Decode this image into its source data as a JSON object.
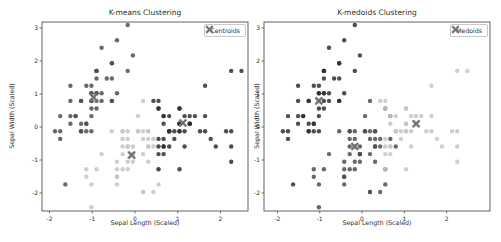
{
  "figure": {
    "background": "#ffffff",
    "spine_color": "#3a3a3a",
    "text_color": "#2e2e2e"
  },
  "chart_data": [
    {
      "type": "scatter",
      "title": "K-means Clustering",
      "xlabel": "Sepal Length (Scaled)",
      "ylabel": "Sepal Width (Scaled)",
      "xlim": [
        -2.175,
        2.643
      ],
      "ylim": [
        -2.545,
        3.182
      ],
      "xticks": [
        -2,
        -1,
        0,
        1,
        2
      ],
      "yticks": [
        -2,
        -1,
        0,
        1,
        2,
        3
      ],
      "grid": false,
      "legend": {
        "label": "Centroids",
        "marker": "x-marker-icon",
        "position": "upper-right"
      },
      "marker_color": "#8a8a8a",
      "marker_core_color": "#5e5e5e",
      "cluster_colors": [
        "#4f4f4f",
        "#c6c6c6",
        "#2f2f2f"
      ],
      "point_radius": 2.2,
      "centers": [
        [
          -0.97,
          0.9
        ],
        [
          -0.08,
          -0.85
        ],
        [
          1.12,
          0.12
        ]
      ],
      "points": [
        [
          -0.9,
          1.02
        ],
        [
          -1.14,
          -0.13
        ],
        [
          -1.39,
          0.33
        ],
        [
          -1.51,
          0.1
        ],
        [
          -1.02,
          1.25
        ],
        [
          -0.54,
          1.93
        ],
        [
          -1.51,
          0.79
        ],
        [
          -1.02,
          0.79
        ],
        [
          -1.75,
          -0.36
        ],
        [
          -1.14,
          0.1
        ],
        [
          -0.54,
          1.47
        ],
        [
          -1.26,
          0.79
        ],
        [
          -1.26,
          -0.13
        ],
        [
          -1.87,
          -0.13
        ],
        [
          -0.05,
          2.17
        ],
        [
          -0.17,
          3.09
        ],
        [
          -0.54,
          1.93
        ],
        [
          -0.9,
          1.02
        ],
        [
          -0.17,
          1.7
        ],
        [
          -0.9,
          1.7
        ],
        [
          -0.54,
          0.79
        ],
        [
          -0.9,
          1.47
        ],
        [
          -1.51,
          1.25
        ],
        [
          -0.9,
          0.56
        ],
        [
          -1.26,
          0.79
        ],
        [
          -1.02,
          -0.13
        ],
        [
          -1.02,
          0.79
        ],
        [
          -0.78,
          1.02
        ],
        [
          -0.78,
          0.79
        ],
        [
          -1.39,
          0.33
        ],
        [
          -1.26,
          0.1
        ],
        [
          -0.54,
          0.79
        ],
        [
          -0.78,
          2.4
        ],
        [
          -0.42,
          2.63
        ],
        [
          -1.14,
          0.1
        ],
        [
          -1.02,
          0.33
        ],
        [
          -0.42,
          1.02
        ],
        [
          -1.14,
          1.25
        ],
        [
          -1.75,
          -0.13
        ],
        [
          -0.9,
          0.79
        ],
        [
          -1.02,
          1.02
        ],
        [
          -1.63,
          -1.74
        ],
        [
          -1.75,
          0.33
        ],
        [
          -1.02,
          1.02
        ],
        [
          -0.9,
          1.7
        ],
        [
          -1.26,
          -0.13
        ],
        [
          -0.9,
          1.7
        ],
        [
          -1.51,
          0.33
        ],
        [
          -0.66,
          1.47
        ],
        [
          -1.02,
          0.56
        ],
        [
          1.4,
          0.33
        ],
        [
          0.67,
          0.33
        ],
        [
          1.28,
          0.1
        ],
        [
          -0.42,
          -1.74
        ],
        [
          0.8,
          -0.59
        ],
        [
          -0.17,
          -0.59
        ],
        [
          0.55,
          0.56
        ],
        [
          -1.14,
          -1.51
        ],
        [
          0.92,
          -0.36
        ],
        [
          -0.78,
          -0.82
        ],
        [
          -1.02,
          -2.43
        ],
        [
          0.07,
          -0.13
        ],
        [
          0.19,
          -1.97
        ],
        [
          0.31,
          -0.36
        ],
        [
          -0.29,
          -0.36
        ],
        [
          1.04,
          0.1
        ],
        [
          -0.29,
          -0.13
        ],
        [
          -0.05,
          -0.82
        ],
        [
          0.43,
          -1.97
        ],
        [
          -0.29,
          -1.28
        ],
        [
          0.07,
          0.33
        ],
        [
          0.31,
          -0.59
        ],
        [
          0.55,
          -1.28
        ],
        [
          0.31,
          -0.59
        ],
        [
          0.67,
          -0.36
        ],
        [
          0.92,
          -0.13
        ],
        [
          1.16,
          -0.59
        ],
        [
          1.04,
          -0.13
        ],
        [
          0.19,
          -0.36
        ],
        [
          -0.17,
          -1.05
        ],
        [
          -0.42,
          -1.51
        ],
        [
          -0.42,
          -1.51
        ],
        [
          -0.05,
          -0.82
        ],
        [
          0.19,
          -0.82
        ],
        [
          -0.54,
          -0.13
        ],
        [
          0.19,
          0.79
        ],
        [
          1.04,
          0.1
        ],
        [
          0.55,
          -1.74
        ],
        [
          -0.29,
          -0.13
        ],
        [
          -0.42,
          -1.28
        ],
        [
          -0.42,
          -1.05
        ],
        [
          0.31,
          -0.13
        ],
        [
          -0.05,
          -1.05
        ],
        [
          -1.02,
          -1.74
        ],
        [
          -0.29,
          -0.82
        ],
        [
          -0.17,
          -0.13
        ],
        [
          -0.17,
          -0.36
        ],
        [
          0.43,
          -0.36
        ],
        [
          -0.9,
          -1.28
        ],
        [
          -0.17,
          -0.59
        ],
        [
          0.55,
          0.56
        ],
        [
          -0.05,
          -0.82
        ],
        [
          1.52,
          -0.13
        ],
        [
          0.55,
          -0.36
        ],
        [
          0.8,
          -0.13
        ],
        [
          2.13,
          -0.13
        ],
        [
          -1.14,
          -1.28
        ],
        [
          1.77,
          -0.36
        ],
        [
          1.04,
          -1.28
        ],
        [
          1.64,
          1.25
        ],
        [
          0.8,
          0.33
        ],
        [
          0.67,
          -0.82
        ],
        [
          1.16,
          -0.13
        ],
        [
          -0.17,
          -1.28
        ],
        [
          -0.05,
          -0.59
        ],
        [
          0.67,
          0.33
        ],
        [
          0.8,
          -0.13
        ],
        [
          2.25,
          1.7
        ],
        [
          2.25,
          -1.05
        ],
        [
          0.19,
          -1.97
        ],
        [
          1.28,
          0.33
        ],
        [
          -0.29,
          -0.59
        ],
        [
          2.25,
          -0.59
        ],
        [
          0.55,
          -0.82
        ],
        [
          1.04,
          0.56
        ],
        [
          1.64,
          0.33
        ],
        [
          0.43,
          -0.59
        ],
        [
          0.31,
          -0.13
        ],
        [
          0.67,
          -0.59
        ],
        [
          1.64,
          -0.13
        ],
        [
          1.89,
          -0.59
        ],
        [
          2.49,
          1.7
        ],
        [
          0.67,
          -0.59
        ],
        [
          0.55,
          -0.59
        ],
        [
          0.31,
          -1.05
        ],
        [
          2.25,
          -0.13
        ],
        [
          0.55,
          0.79
        ],
        [
          0.67,
          0.1
        ],
        [
          0.19,
          -0.13
        ],
        [
          1.28,
          0.1
        ],
        [
          1.04,
          0.1
        ],
        [
          1.28,
          0.1
        ],
        [
          -0.05,
          -0.82
        ],
        [
          1.16,
          0.33
        ],
        [
          1.04,
          0.56
        ],
        [
          1.04,
          -0.13
        ],
        [
          0.55,
          -1.28
        ],
        [
          0.8,
          -0.13
        ],
        [
          0.43,
          0.79
        ],
        [
          0.07,
          -0.13
        ]
      ],
      "clusters": [
        0,
        0,
        0,
        0,
        0,
        0,
        0,
        0,
        0,
        0,
        0,
        0,
        0,
        0,
        0,
        0,
        0,
        0,
        0,
        0,
        0,
        0,
        0,
        0,
        0,
        0,
        0,
        0,
        0,
        0,
        0,
        0,
        0,
        0,
        0,
        0,
        0,
        0,
        0,
        0,
        0,
        0,
        0,
        0,
        0,
        0,
        0,
        0,
        0,
        0,
        2,
        2,
        2,
        1,
        2,
        1,
        2,
        1,
        2,
        1,
        1,
        1,
        1,
        1,
        1,
        2,
        1,
        1,
        1,
        1,
        1,
        1,
        1,
        1,
        2,
        2,
        2,
        2,
        1,
        1,
        1,
        1,
        1,
        1,
        1,
        1,
        2,
        1,
        1,
        1,
        1,
        1,
        1,
        1,
        1,
        1,
        1,
        1,
        1,
        1,
        2,
        1,
        2,
        2,
        2,
        2,
        1,
        2,
        2,
        2,
        2,
        2,
        2,
        1,
        1,
        2,
        2,
        2,
        2,
        1,
        2,
        1,
        2,
        2,
        2,
        2,
        1,
        1,
        2,
        2,
        2,
        2,
        2,
        2,
        1,
        2,
        2,
        2,
        1,
        2,
        2,
        2,
        1,
        2,
        2,
        2,
        2,
        2,
        2,
        1
      ]
    },
    {
      "type": "scatter",
      "title": "K-medoids Clustering",
      "xlabel": "Sepal Length (Scaled)",
      "ylabel": "Sepal Width (Scaled)",
      "xlim": [
        -2.317,
        3.026
      ],
      "ylim": [
        -2.545,
        3.182
      ],
      "xticks": [
        -2,
        -1,
        0,
        1,
        2
      ],
      "yticks": [
        -2,
        -1,
        0,
        1,
        2,
        3
      ],
      "grid": false,
      "legend": {
        "label": "Medoids",
        "marker": "x-marker-icon",
        "position": "upper-right"
      },
      "marker_color": "#8a8a8a",
      "marker_core_color": "#5e5e5e",
      "cluster_colors": [
        "#2f2f2f",
        "#4f4f4f",
        "#c6c6c6"
      ],
      "point_radius": 2.2,
      "centers": [
        [
          -1.02,
          0.79
        ],
        [
          -0.17,
          -0.59
        ],
        [
          1.28,
          0.1
        ]
      ],
      "points_shared_with": 0,
      "clusters": [
        0,
        0,
        0,
        0,
        0,
        0,
        0,
        0,
        0,
        0,
        0,
        0,
        0,
        0,
        0,
        0,
        0,
        0,
        0,
        0,
        0,
        0,
        0,
        0,
        0,
        0,
        0,
        0,
        0,
        0,
        0,
        0,
        0,
        0,
        0,
        0,
        0,
        0,
        0,
        0,
        0,
        0,
        0,
        0,
        0,
        0,
        0,
        0,
        0,
        0,
        2,
        1,
        2,
        1,
        1,
        1,
        1,
        1,
        2,
        1,
        1,
        1,
        1,
        1,
        1,
        2,
        1,
        1,
        1,
        1,
        1,
        1,
        1,
        1,
        1,
        2,
        2,
        2,
        1,
        1,
        1,
        1,
        1,
        1,
        1,
        1,
        2,
        1,
        1,
        1,
        1,
        1,
        1,
        1,
        1,
        1,
        1,
        1,
        1,
        1,
        2,
        1,
        2,
        2,
        2,
        2,
        1,
        2,
        2,
        2,
        2,
        2,
        2,
        1,
        1,
        2,
        2,
        2,
        2,
        1,
        2,
        1,
        2,
        2,
        2,
        2,
        1,
        1,
        2,
        2,
        2,
        2,
        2,
        2,
        1,
        2,
        2,
        2,
        1,
        2,
        2,
        2,
        1,
        2,
        2,
        2,
        2,
        2,
        2,
        1
      ]
    }
  ]
}
